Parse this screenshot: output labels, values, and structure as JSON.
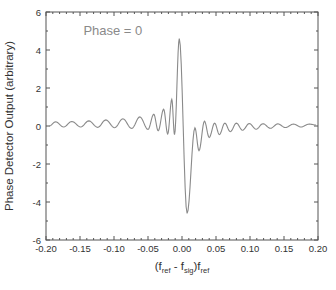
{
  "chart_data": {
    "type": "line",
    "title": "",
    "xlabel": {
      "main": "(f",
      "parts": [
        {
          "text": "(f",
          "sub": false
        },
        {
          "text": "ref",
          "sub": true
        },
        {
          "text": " - f",
          "sub": false
        },
        {
          "text": "sig",
          "sub": true
        },
        {
          "text": ")f",
          "sub": false
        },
        {
          "text": "ref",
          "sub": true
        }
      ]
    },
    "ylabel": "Phase Detector Output (arbitrary)",
    "xlim": [
      -0.2,
      0.2
    ],
    "ylim": [
      -6,
      6
    ],
    "xticks": [
      -0.2,
      -0.15,
      -0.1,
      -0.05,
      0.0,
      0.05,
      0.1,
      0.15,
      0.2
    ],
    "xtick_labels": [
      "-0.20",
      "-0.15",
      "-0.10",
      "-0.05",
      "0.00",
      "0.05",
      "0.10",
      "0.15",
      "0.20"
    ],
    "yticks": [
      -6,
      -4,
      -2,
      0,
      2,
      4,
      6
    ],
    "ytick_labels": [
      "-6",
      "-4",
      "-2",
      "0",
      "2",
      "4",
      "6"
    ],
    "x_minor_per_major": 5,
    "y_minor_per_major": 2,
    "grid": false,
    "annotations": [
      {
        "text": "Phase = 0",
        "x": -0.145,
        "y": 4.8
      }
    ],
    "series": [
      {
        "name": "Phase = 0",
        "color": "#8a8a8a",
        "model": "oscillating derivative of sinc-like response, period ~0.0125",
        "extrema": [
          {
            "x": -0.195,
            "y": 0.0
          },
          {
            "x": -0.186,
            "y": 0.22
          },
          {
            "x": -0.174,
            "y": -0.05
          },
          {
            "x": -0.162,
            "y": 0.24
          },
          {
            "x": -0.149,
            "y": -0.05
          },
          {
            "x": -0.137,
            "y": 0.27
          },
          {
            "x": -0.124,
            "y": -0.07
          },
          {
            "x": -0.112,
            "y": 0.32
          },
          {
            "x": -0.099,
            "y": -0.09
          },
          {
            "x": -0.087,
            "y": 0.38
          },
          {
            "x": -0.074,
            "y": -0.13
          },
          {
            "x": -0.062,
            "y": 0.48
          },
          {
            "x": -0.05,
            "y": -0.18
          },
          {
            "x": -0.0415,
            "y": 0.62
          },
          {
            "x": -0.035,
            "y": -0.25
          },
          {
            "x": -0.027,
            "y": 0.88
          },
          {
            "x": -0.021,
            "y": -0.42
          },
          {
            "x": -0.015,
            "y": 1.4
          },
          {
            "x": -0.011,
            "y": -0.45
          },
          {
            "x": -0.004,
            "y": 4.6
          },
          {
            "x": 0.0075,
            "y": -4.6
          },
          {
            "x": 0.019,
            "y": -0.1
          },
          {
            "x": 0.025,
            "y": -1.3
          },
          {
            "x": 0.033,
            "y": 0.25
          },
          {
            "x": 0.04,
            "y": -0.6
          },
          {
            "x": 0.048,
            "y": 0.15
          },
          {
            "x": 0.055,
            "y": -0.45
          },
          {
            "x": 0.063,
            "y": 0.15
          },
          {
            "x": 0.071,
            "y": -0.3
          },
          {
            "x": 0.08,
            "y": 0.15
          },
          {
            "x": 0.089,
            "y": -0.22
          },
          {
            "x": 0.099,
            "y": 0.13
          },
          {
            "x": 0.109,
            "y": -0.17
          },
          {
            "x": 0.119,
            "y": 0.12
          },
          {
            "x": 0.13,
            "y": -0.12
          },
          {
            "x": 0.141,
            "y": 0.11
          },
          {
            "x": 0.152,
            "y": -0.08
          },
          {
            "x": 0.164,
            "y": 0.1
          },
          {
            "x": 0.175,
            "y": -0.05
          },
          {
            "x": 0.187,
            "y": 0.1
          },
          {
            "x": 0.197,
            "y": 0.05
          }
        ]
      }
    ],
    "legend": "none"
  }
}
